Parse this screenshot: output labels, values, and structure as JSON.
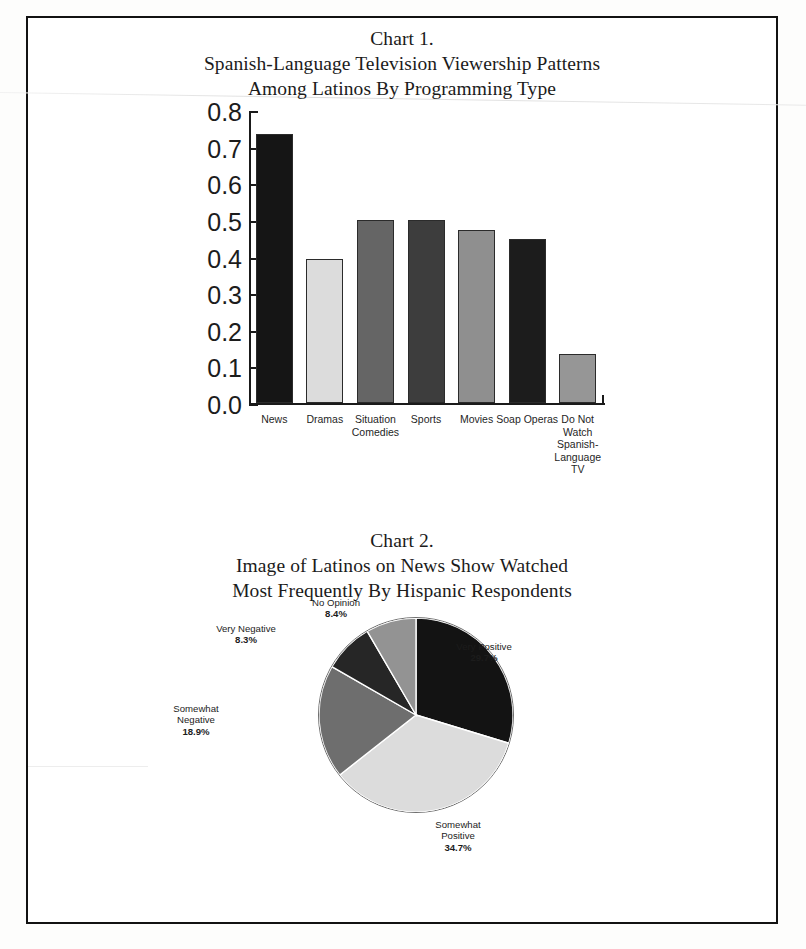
{
  "document": {
    "chart1_title_lines": [
      "Chart 1.",
      "Spanish-Language Television Viewership Patterns",
      "Among Latinos By Programming Type"
    ],
    "chart2_title_lines": [
      "Chart 2.",
      "Image of Latinos on News Show Watched",
      "Most Frequently By Hispanic Respondents"
    ]
  },
  "chart_data": [
    {
      "type": "bar",
      "title": "Chart 1. Spanish-Language Television Viewership Patterns Among Latinos By Programming Type",
      "xlabel": "",
      "ylabel": "",
      "ylim": [
        0,
        0.8
      ],
      "ytick_labels": [
        "0.8",
        "0.7",
        "0.6",
        "0.5",
        "0.4",
        "0.3",
        "0.2",
        "0.1",
        "0.0"
      ],
      "ytick_values": [
        0.8,
        0.7,
        0.6,
        0.5,
        0.4,
        0.3,
        0.2,
        0.1,
        0.0
      ],
      "grid": false,
      "legend": "none",
      "categories": [
        "News",
        "Dramas",
        "Situation\nComedies",
        "Sports",
        "Movies",
        "Soap\nOperas",
        "Do Not\nWatch\nSpanish-\nLanguage TV"
      ],
      "values": [
        0.735,
        0.392,
        0.5,
        0.5,
        0.472,
        0.447,
        0.133
      ],
      "bar_colors": [
        "#151515",
        "#dcdcdc",
        "#656565",
        "#3d3d3d",
        "#8f8f8f",
        "#1c1c1c",
        "#969696"
      ]
    },
    {
      "type": "pie",
      "title": "Chart 2. Image of Latinos on News Show Watched Most Frequently By Hispanic Respondents",
      "legend": "labels-outside",
      "start_angle_deg": 0,
      "direction": "clockwise",
      "labels": [
        "Very Positive",
        "Somewhat\nPositive",
        "Somewhat\nNegative",
        "Very Negative",
        "No Opinion"
      ],
      "values": [
        29.7,
        34.7,
        18.9,
        8.3,
        8.4
      ],
      "value_labels": [
        "29.7%",
        "34.7%",
        "18.9%",
        "8.3%",
        "8.4%"
      ],
      "slice_colors": [
        "#131313",
        "#dcdcdc",
        "#6e6e6e",
        "#262626",
        "#939393"
      ]
    }
  ]
}
